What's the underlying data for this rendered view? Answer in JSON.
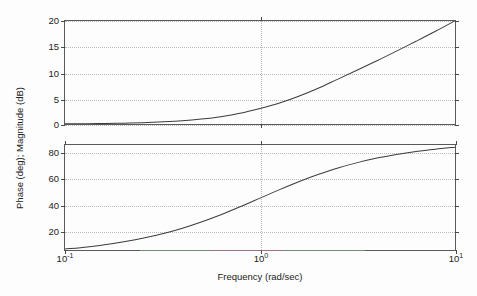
{
  "figure": {
    "background_color": "#fdfdfd",
    "axis_color": "#5a5a5a",
    "grid_color": "#b9b9b9",
    "curve_color": "#3c3c3c"
  },
  "labels": {
    "y_axis_title": "Phase (deg); Magnitude (dB)",
    "x_axis_title": "Frequency (rad/sec)"
  },
  "xticks": [
    {
      "value": 0.1,
      "mantissa": "10",
      "exponent": "-1"
    },
    {
      "value": 1,
      "mantissa": "10",
      "exponent": "0"
    },
    {
      "value": 10,
      "mantissa": "10",
      "exponent": "1"
    }
  ],
  "magnitude": {
    "yticks": [
      "0",
      "5",
      "10",
      "15",
      "20"
    ]
  },
  "phase": {
    "yticks": [
      "20",
      "40",
      "60",
      "80"
    ]
  },
  "chart_data": [
    {
      "type": "line",
      "title": "",
      "subtitle": "",
      "panel": "magnitude",
      "xlabel": "Frequency (rad/sec)",
      "ylabel": "Magnitude (dB)",
      "xscale": "log",
      "xlim": [
        0.1,
        10
      ],
      "ylim": [
        0,
        20
      ],
      "xticks": [
        0.1,
        1,
        10
      ],
      "xticklabels": [
        "10^-1",
        "10^0",
        "10^1"
      ],
      "yticks": [
        0,
        5,
        10,
        15,
        20
      ],
      "yticklabels": [
        "0",
        "5",
        "10",
        "15",
        "20"
      ],
      "grid": true,
      "legend": null,
      "series": [
        {
          "name": "Magnitude",
          "color": "#3c3c3c",
          "x": [
            0.1,
            0.13,
            0.16,
            0.2,
            0.25,
            0.32,
            0.4,
            0.5,
            0.63,
            0.79,
            1.0,
            1.26,
            1.58,
            2.0,
            2.51,
            3.16,
            3.98,
            5.01,
            6.31,
            7.94,
            10.0
          ],
          "y": [
            0.04,
            0.07,
            0.11,
            0.17,
            0.26,
            0.43,
            0.64,
            0.97,
            1.43,
            2.07,
            3.01,
            4.08,
            5.38,
            6.99,
            8.72,
            10.47,
            12.29,
            14.15,
            16.06,
            18.0,
            20.04
          ]
        }
      ]
    },
    {
      "type": "line",
      "title": "",
      "subtitle": "",
      "panel": "phase",
      "xlabel": "Frequency (rad/sec)",
      "ylabel": "Phase (deg)",
      "xscale": "log",
      "xlim": [
        0.1,
        10
      ],
      "ylim": [
        5,
        86
      ],
      "xticks": [
        0.1,
        1,
        10
      ],
      "xticklabels": [
        "10^-1",
        "10^0",
        "10^1"
      ],
      "yticks": [
        20,
        40,
        60,
        80
      ],
      "yticklabels": [
        "20",
        "40",
        "60",
        "80"
      ],
      "grid": true,
      "legend": null,
      "series": [
        {
          "name": "Phase",
          "color": "#3c3c3c",
          "x": [
            0.1,
            0.13,
            0.16,
            0.2,
            0.25,
            0.32,
            0.4,
            0.5,
            0.63,
            0.79,
            1.0,
            1.26,
            1.58,
            2.0,
            2.51,
            3.16,
            3.98,
            5.01,
            6.31,
            7.94,
            10.0
          ],
          "y": [
            5.7,
            7.4,
            9.1,
            11.3,
            14.0,
            17.7,
            21.8,
            26.6,
            32.2,
            38.3,
            45.0,
            51.6,
            57.7,
            63.4,
            68.3,
            72.4,
            75.9,
            78.7,
            81.0,
            82.8,
            84.3
          ]
        }
      ]
    }
  ]
}
